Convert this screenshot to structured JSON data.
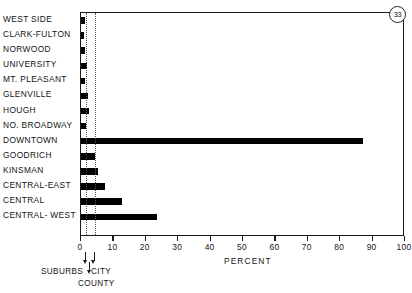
{
  "badge": {
    "number": "33"
  },
  "chart_data": {
    "type": "bar",
    "orientation": "horizontal",
    "title": "",
    "xlabel": "PERCENT",
    "ylabel": "",
    "xlim": [
      0,
      100
    ],
    "grid": false,
    "legend": null,
    "categories": [
      "WEST SIDE",
      "CLARK-FULTON",
      "NORWOOD",
      "UNIVERSITY",
      "MT. PLEASANT",
      "GLENVILLE",
      "HOUGH",
      "NO. BROADWAY",
      "DOWNTOWN",
      "GOODRICH",
      "KINSMAN",
      "CENTRAL-EAST",
      "CENTRAL",
      "CENTRAL- WEST"
    ],
    "values": [
      1.2,
      0.8,
      1.3,
      2.0,
      1.1,
      2.2,
      2.6,
      1.4,
      87.0,
      4.3,
      5.2,
      7.4,
      12.7,
      23.5
    ],
    "xticks": [
      0,
      10,
      20,
      30,
      40,
      50,
      60,
      70,
      80,
      90,
      100
    ],
    "xtick_labels": [
      "0",
      "10",
      "20",
      "30",
      "40",
      "50",
      "60",
      "70",
      "80",
      "90",
      "100"
    ],
    "reference_lines": [
      {
        "name": "county-line",
        "value": 1.6,
        "style": "dotted"
      },
      {
        "name": "city-line",
        "value": 4.2,
        "style": "dotted"
      }
    ],
    "annotations": [
      {
        "name": "suburbs",
        "label": "SUBURBS",
        "arrow_at": 1.6
      },
      {
        "name": "city",
        "label": "CITY",
        "arrow_at": 4.2
      },
      {
        "name": "county",
        "label": "COUNTY",
        "arrow_at": 2.9
      }
    ]
  }
}
